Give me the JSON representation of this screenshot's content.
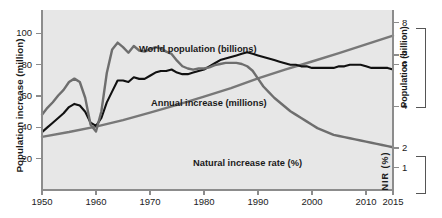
{
  "chart_data": {
    "type": "line",
    "title": "",
    "xlabel": "",
    "ylabel": "Population increase (million)",
    "xlim": [
      1950,
      2015
    ],
    "x_ticks": [
      "1950",
      "1960",
      "1970",
      "1980",
      "1990",
      "2000",
      "2010",
      "2015"
    ],
    "x_tick_values": [
      1950,
      1960,
      1970,
      1980,
      1990,
      2000,
      2010,
      2015
    ],
    "left_axis": {
      "label": "Population increase (million)",
      "ticks": [
        "20",
        "40",
        "60",
        "80",
        "100"
      ],
      "tick_values": [
        20,
        40,
        60,
        80,
        100
      ],
      "lim": [
        0,
        115
      ]
    },
    "right_axis_population": {
      "label": "Population (billion)",
      "ticks": [
        "2",
        "4",
        "6",
        "8"
      ],
      "tick_values": [
        2,
        4,
        6,
        8
      ],
      "lim": [
        0,
        8.6
      ]
    },
    "right_axis_nir": {
      "label": "NIR (%)",
      "label_chars": [
        "N",
        "I",
        "R",
        "(",
        "%",
        ")"
      ],
      "ticks": [
        "1",
        "2"
      ],
      "tick_values": [
        1,
        2
      ],
      "lim": [
        0.8,
        2.4
      ]
    },
    "grid": false,
    "legend_position": "inline-annotations",
    "series": [
      {
        "name": "World population (billions)",
        "color": "#787878",
        "axis": "right_axis_population",
        "annotation": "World population (billions)",
        "x": [
          1950,
          1955,
          1960,
          1965,
          1970,
          1975,
          1980,
          1985,
          1990,
          1995,
          2000,
          2005,
          2010,
          2015
        ],
        "values": [
          2.54,
          2.77,
          3.03,
          3.34,
          3.7,
          4.07,
          4.46,
          4.87,
          5.33,
          5.75,
          6.14,
          6.54,
          6.96,
          7.38
        ]
      },
      {
        "name": "Annual increase (millions)",
        "color": "#111111",
        "axis": "left_axis",
        "annotation": "Annual increase (millions)",
        "x": [
          1950,
          1951,
          1952,
          1953,
          1954,
          1955,
          1956,
          1957,
          1958,
          1959,
          1960,
          1961,
          1962,
          1963,
          1964,
          1965,
          1966,
          1967,
          1968,
          1969,
          1970,
          1971,
          1972,
          1973,
          1974,
          1975,
          1976,
          1977,
          1978,
          1979,
          1980,
          1981,
          1982,
          1983,
          1984,
          1985,
          1986,
          1987,
          1988,
          1989,
          1990,
          1991,
          1992,
          1993,
          1994,
          1995,
          1996,
          1997,
          1998,
          1999,
          2000,
          2001,
          2002,
          2003,
          2004,
          2005,
          2006,
          2007,
          2008,
          2009,
          2010,
          2011,
          2012,
          2013,
          2014,
          2015
        ],
        "values": [
          37,
          40,
          43,
          46,
          49,
          53,
          55,
          54,
          50,
          43,
          41,
          46,
          56,
          63,
          70,
          70,
          69,
          72,
          71,
          71,
          73,
          75,
          76,
          76,
          77,
          75,
          74,
          74,
          75,
          76,
          77,
          79,
          81,
          83,
          84,
          85,
          86,
          87,
          88,
          87,
          86,
          85,
          84,
          83,
          82,
          81,
          80,
          80,
          79,
          79,
          78,
          78,
          78,
          78,
          78,
          79,
          79,
          80,
          80,
          80,
          79,
          78,
          78,
          78,
          78,
          77
        ]
      },
      {
        "name": "Natural increase rate (%)",
        "color": "#6e6e6e",
        "axis": "right_axis_nir",
        "annotation": "Natural increase rate (%)",
        "x": [
          1950,
          1951,
          1952,
          1953,
          1954,
          1955,
          1956,
          1957,
          1958,
          1959,
          1960,
          1961,
          1962,
          1963,
          1964,
          1965,
          1966,
          1967,
          1968,
          1969,
          1970,
          1971,
          1972,
          1973,
          1974,
          1975,
          1976,
          1977,
          1978,
          1979,
          1980,
          1981,
          1982,
          1983,
          1984,
          1985,
          1986,
          1987,
          1988,
          1989,
          1990,
          1991,
          1992,
          1993,
          1994,
          1995,
          1996,
          1997,
          1998,
          1999,
          2000,
          2001,
          2002,
          2003,
          2004,
          2005,
          2006,
          2007,
          2008,
          2009,
          2010,
          2011,
          2012,
          2013,
          2014,
          2015
        ],
        "values": [
          1.47,
          1.53,
          1.58,
          1.64,
          1.69,
          1.76,
          1.79,
          1.76,
          1.62,
          1.38,
          1.32,
          1.5,
          1.84,
          2.05,
          2.11,
          2.07,
          2.02,
          2.08,
          2.04,
          2.03,
          2.05,
          2.07,
          2.06,
          2.03,
          2.01,
          1.95,
          1.9,
          1.88,
          1.87,
          1.88,
          1.88,
          1.89,
          1.91,
          1.92,
          1.93,
          1.93,
          1.93,
          1.92,
          1.9,
          1.86,
          1.79,
          1.72,
          1.67,
          1.62,
          1.58,
          1.54,
          1.5,
          1.47,
          1.44,
          1.41,
          1.38,
          1.35,
          1.33,
          1.31,
          1.29,
          1.28,
          1.27,
          1.26,
          1.25,
          1.24,
          1.23,
          1.22,
          1.21,
          1.2,
          1.19,
          1.18
        ]
      }
    ]
  },
  "annotations": {
    "world_population": "World population (billions)",
    "annual_increase": "Annual increase (millions)",
    "natural_increase_rate": "Natural increase rate (%)"
  },
  "axes": {
    "left_title": "Population increase (million)",
    "right_population_title": "Population (billion)",
    "right_nir_title": "NIR (%)"
  },
  "colors": {
    "plot_background": "#e7e7e7",
    "page_background": "#ffffff",
    "axis": "#8c8c8c",
    "world_population_line": "#787878",
    "annual_increase_line": "#111111",
    "nir_line": "#6e6e6e",
    "text": "#1a1a1a"
  }
}
